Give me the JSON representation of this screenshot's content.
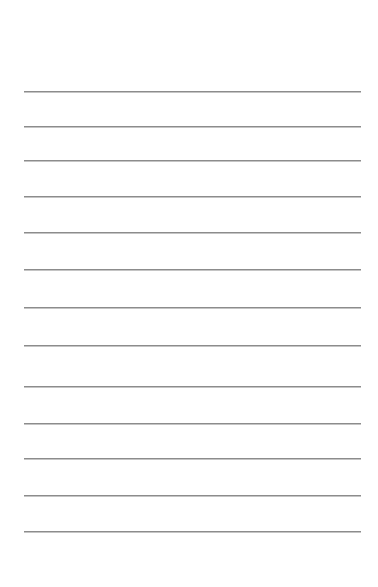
{
  "page": {
    "type": "lined-paper",
    "background": "#ffffff",
    "line_color": "#8c8c8c",
    "line_left": 24,
    "line_width": 337,
    "lines": [
      91,
      126,
      160,
      196,
      232,
      269,
      307,
      345,
      386,
      423,
      458,
      495,
      531
    ]
  }
}
